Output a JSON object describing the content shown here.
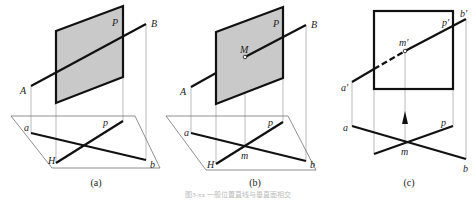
{
  "figure": {
    "caption_faint": "图3-xx 一般位置直线与垂直面相交"
  },
  "panels": [
    {
      "id": "a",
      "caption": "(a)",
      "labels": {
        "plane": "P",
        "A": "A",
        "B": "B",
        "a": "a",
        "b": "b",
        "p": "p",
        "H": "H"
      }
    },
    {
      "id": "b",
      "caption": "(b)",
      "labels": {
        "plane": "P",
        "A": "A",
        "B": "B",
        "M": "M",
        "a": "a",
        "b": "b",
        "p": "p",
        "H": "H",
        "m": "m"
      }
    },
    {
      "id": "c",
      "caption": "(c)",
      "labels": {
        "a_prime": "a′",
        "b_prime": "b′",
        "p_prime": "p′",
        "m_prime": "m′",
        "a": "a",
        "b": "b",
        "p": "p",
        "m": "m"
      }
    }
  ],
  "colors": {
    "plane_fill": "#c9c9c9",
    "line": "#111111"
  }
}
